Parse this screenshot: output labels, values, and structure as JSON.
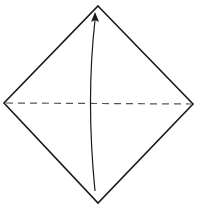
{
  "diagram": {
    "type": "origami-fold-step",
    "background": "#ffffff",
    "stroke_color": "#1a1a1a",
    "dash_color": "#555555",
    "paper": {
      "shape": "square-diamond",
      "vertices": {
        "top": [
          98,
          6
        ],
        "right": [
          193,
          104
        ],
        "bottom": [
          98,
          203
        ],
        "left": [
          4,
          103
        ]
      }
    },
    "fold_line": {
      "style": "valley-dashed",
      "from": [
        6,
        103
      ],
      "to": [
        191,
        104
      ]
    },
    "arrow": {
      "direction": "up",
      "meaning": "fold bottom corner to top corner",
      "start": [
        95,
        191
      ],
      "end": [
        95,
        14
      ]
    }
  }
}
